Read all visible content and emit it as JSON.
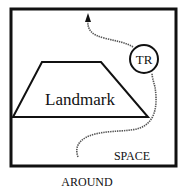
{
  "diagram": {
    "landmark_label": "Landmark",
    "trajector_label": "TR",
    "region_label": "SPACE",
    "caption": "AROUND"
  },
  "colors": {
    "ink": "#111111",
    "path": "#555555",
    "background": "#ffffff"
  }
}
